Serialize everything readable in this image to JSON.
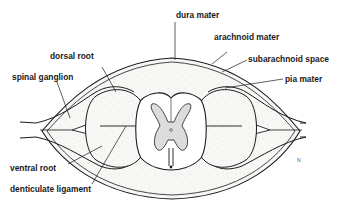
{
  "diagram": {
    "labels": {
      "dura_mater": "dura mater",
      "arachnoid_mater": "arachnoid mater",
      "subarachnoid_space": "subarachnoid space",
      "pia_mater": "pia mater",
      "dorsal_root": "dorsal root",
      "spinal_ganglion": "spinal ganglion",
      "ventral_root": "ventral root",
      "denticulate_ligament": "denticulate ligament"
    },
    "colors": {
      "line": "#1a1a1a",
      "background": "#ffffff",
      "stipple_fill": "#f4f4f2",
      "grey_matter": "#dcdcdc"
    }
  }
}
